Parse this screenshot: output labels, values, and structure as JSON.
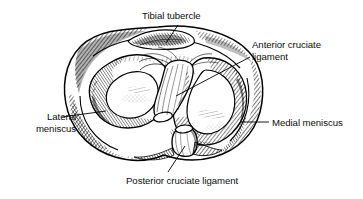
{
  "figure": {
    "type": "anatomical-line-drawing",
    "style": "black-and-white pen-and-ink engraving with cross-hatching",
    "background_color": "#ffffff",
    "ink_color": "#000000"
  },
  "labels": {
    "tibial_tubercle": "Tibial tubercle",
    "anterior_cruciate_line1": "Anterior cruciate",
    "anterior_cruciate_line2": "ligament",
    "lateral_meniscus_line1": "Lateral",
    "lateral_meniscus_line2": "meniscus",
    "medial_meniscus": "Medial meniscus",
    "posterior_cruciate": "Posterior cruciate ligament"
  },
  "structures": [
    {
      "name": "tibial-tubercle",
      "label": "Tibial tubercle",
      "position": "top-center"
    },
    {
      "name": "anterior-cruciate-ligament",
      "label": "Anterior cruciate ligament",
      "position": "center"
    },
    {
      "name": "lateral-meniscus",
      "label": "Lateral meniscus",
      "position": "left"
    },
    {
      "name": "medial-meniscus",
      "label": "Medial meniscus",
      "position": "right"
    },
    {
      "name": "posterior-cruciate-ligament",
      "label": "Posterior cruciate ligament",
      "position": "bottom-center"
    }
  ],
  "leaders": [
    {
      "name": "leader-tibial-tubercle",
      "from": [
        178,
        25
      ],
      "to": [
        166,
        43
      ]
    },
    {
      "name": "leader-anterior-cruciate",
      "from": [
        250,
        57
      ],
      "to": [
        176,
        96
      ]
    },
    {
      "name": "leader-lateral-meniscus",
      "from": [
        62,
        118
      ],
      "to": [
        105,
        112
      ]
    },
    {
      "name": "leader-medial-meniscus",
      "from": [
        268,
        122
      ],
      "to": [
        240,
        122
      ]
    },
    {
      "name": "leader-posterior-cruciate",
      "from": [
        168,
        172
      ],
      "to": [
        184,
        146
      ]
    }
  ]
}
